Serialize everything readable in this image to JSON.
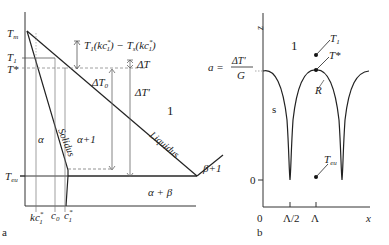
{
  "panel_a": {
    "label": "a",
    "y_labels": {
      "tm": "T",
      "tm_sub": "m",
      "t1": "T",
      "t1_sub": "1",
      "tstar": "T*",
      "teu": "T",
      "teu_sub": "eu"
    },
    "x_labels": {
      "kc": "kc",
      "kc_sup": "*",
      "kc_sub": "1",
      "c0": "c",
      "c0_sub": "0",
      "c1": "c",
      "c1_sup": "*",
      "c1_sub": "1"
    },
    "regions": {
      "alpha": "α",
      "alpha_l": "α+1",
      "liquid": "1",
      "alpha_beta": "α + β",
      "beta_l": "β+1"
    },
    "curves": {
      "solidus": "Solidus",
      "liquidus": "Liquidus"
    },
    "annotations": {
      "top_formula": "T1(kc1*) − Ts(kc1*)",
      "delta_t": "ΔT",
      "delta_t0": "ΔT",
      "delta_t0_sub": "0",
      "delta_t_prime": "ΔT'"
    }
  },
  "panel_b": {
    "label": "b",
    "axis": {
      "z": "z",
      "x": "x",
      "zero_y": "0",
      "zero_x": "0",
      "tick_half": "Λ/2",
      "tick_full": "Λ"
    },
    "regions": {
      "liquid": "1",
      "solid": "s"
    },
    "formula": {
      "a": "a =",
      "num": "ΔT'",
      "den": "G"
    },
    "points": {
      "t1": "T",
      "t1_sub": "1",
      "tstar": "T*",
      "r": "R",
      "teu": "T",
      "teu_sub": "eu"
    }
  }
}
